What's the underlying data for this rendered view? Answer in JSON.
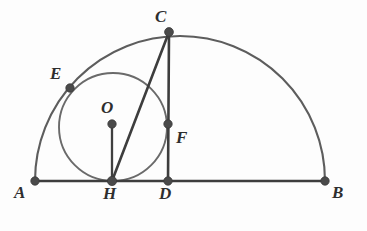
{
  "figure": {
    "width": 367,
    "height": 231,
    "background_color": "#fdfdfd",
    "stroke_colors": {
      "segment": "#3d3d3d",
      "arc": "#5d5d5d",
      "circle": "#6a6a6a",
      "vertex": "#4a4a4a",
      "label": "#2e2e2e"
    }
  },
  "points": [
    {
      "id": "A",
      "label": "A",
      "x": 35,
      "y": 181,
      "label_x": 14,
      "label_y": 184
    },
    {
      "id": "B",
      "label": "B",
      "x": 325,
      "y": 181,
      "label_x": 332,
      "label_y": 184
    },
    {
      "id": "C",
      "label": "C",
      "x": 169,
      "y": 32,
      "label_x": 155,
      "label_y": 8
    },
    {
      "id": "D",
      "label": "D",
      "x": 168,
      "y": 181,
      "label_x": 159,
      "label_y": 185
    },
    {
      "id": "E",
      "label": "E",
      "x": 70,
      "y": 88,
      "label_x": 50,
      "label_y": 65
    },
    {
      "id": "F",
      "label": "F",
      "x": 168,
      "y": 124,
      "label_x": 176,
      "label_y": 129
    },
    {
      "id": "H",
      "label": "H",
      "x": 112,
      "y": 181,
      "label_x": 103,
      "label_y": 185
    },
    {
      "id": "O",
      "label": "O",
      "x": 112,
      "y": 124,
      "label_x": 101,
      "label_y": 99
    }
  ],
  "segments": [
    {
      "id": "AB",
      "from": "A",
      "to": "B",
      "kind": "diameter"
    },
    {
      "id": "CH",
      "from": "C",
      "to": "H",
      "kind": "chord"
    },
    {
      "id": "CD",
      "from": "C",
      "to": "D",
      "kind": "altitude"
    },
    {
      "id": "OH",
      "from": "O",
      "to": "H",
      "kind": "radius"
    }
  ],
  "arcs": [
    {
      "id": "semicircle-AB",
      "kind": "semicircle",
      "center_x": 180,
      "center_y": 181,
      "radius": 145,
      "from": "A",
      "to": "B"
    }
  ],
  "circles": [
    {
      "id": "incircle-O",
      "kind": "circle",
      "center": "O",
      "center_x": 113,
      "center_y": 127,
      "radius": 54,
      "tangent_points": [
        "H",
        "E"
      ]
    }
  ],
  "labels": {
    "A": "A",
    "B": "B",
    "C": "C",
    "D": "D",
    "E": "E",
    "F": "F",
    "H": "H",
    "O": "O"
  }
}
